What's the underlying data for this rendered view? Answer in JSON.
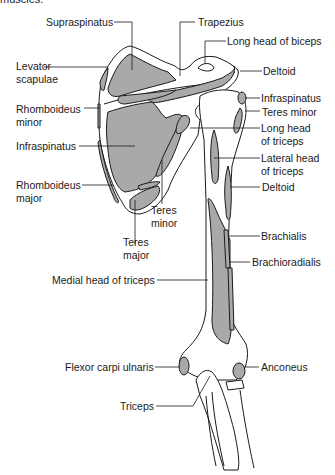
{
  "caption": "muscles.",
  "colors": {
    "muscle_fill": "#a9a9a9",
    "bone_fill": "#ffffff",
    "outline": "#1a1a1a",
    "background": "#ffffff"
  },
  "labels": {
    "supraspinatus": "Supraspinatus",
    "trapezius": "Trapezius",
    "long_head_biceps": "Long head of biceps",
    "levator_scapulae_1": "Levator",
    "levator_scapulae_2": "scapulae",
    "deltoid_top": "Deltoid",
    "infraspinatus_right": "Infraspinatus",
    "teres_minor_right": "Teres minor",
    "rhomboideus_minor_1": "Rhomboideus",
    "rhomboideus_minor_2": "minor",
    "long_head_triceps_1": "Long head",
    "long_head_triceps_2": "of triceps",
    "infraspinatus_left": "Infraspinatus",
    "lateral_head_triceps_1": "Lateral head",
    "lateral_head_triceps_2": "of triceps",
    "rhomboideus_major_1": "Rhomboideus",
    "rhomboideus_major_2": "major",
    "deltoid_mid": "Deltoid",
    "teres_minor_center_1": "Teres",
    "teres_minor_center_2": "minor",
    "teres_major_1": "Teres",
    "teres_major_2": "major",
    "brachialis": "Brachialis",
    "brachioradialis": "Brachioradialis",
    "medial_head_triceps": "Medial head of triceps",
    "flexor_carpi_ulnaris": "Flexor carpi ulnaris",
    "anconeus": "Anconeus",
    "triceps": "Triceps"
  }
}
